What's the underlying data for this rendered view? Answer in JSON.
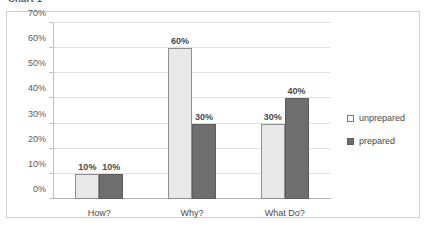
{
  "title_strip": "Chart 1",
  "chart_data": {
    "type": "bar",
    "title": "Chart 1",
    "xlabel": "",
    "ylabel": "",
    "ylim": [
      0,
      70
    ],
    "ytick_labels": [
      "0%",
      "10%",
      "20%",
      "30%",
      "40%",
      "50%",
      "60%",
      "70%"
    ],
    "ytick_values": [
      0,
      10,
      20,
      30,
      40,
      50,
      60,
      70
    ],
    "grid": true,
    "legend_position": "right",
    "categories": [
      "How?",
      "Why?",
      "What Do?"
    ],
    "series": [
      {
        "name": "unprepared",
        "color": "#e8e8e8",
        "values": [
          10,
          60,
          30
        ],
        "labels": [
          "10%",
          "60%",
          "30%"
        ]
      },
      {
        "name": "prepared",
        "color": "#6e6e6e",
        "values": [
          10,
          30,
          40
        ],
        "labels": [
          "10%",
          "30%",
          "40%"
        ]
      }
    ]
  },
  "legend": {
    "items": [
      {
        "label": "unprepared",
        "swatch": "unprepared"
      },
      {
        "label": "prepared",
        "swatch": "prepared"
      }
    ]
  }
}
